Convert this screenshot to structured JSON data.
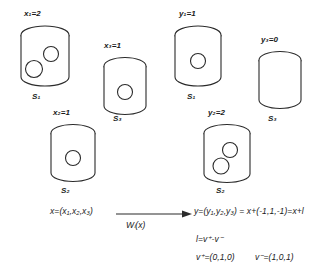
{
  "diagram": {
    "stroke_color": "#2b2b2b",
    "background": "#ffffff",
    "containers": [
      {
        "id": "left-s1",
        "var_label": "x",
        "var_sub": "1",
        "var_value": "2",
        "var_text": "x₁=2",
        "name_label": "S",
        "name_sub": "1",
        "name_text": "S₁",
        "items": 2,
        "side": "left"
      },
      {
        "id": "left-s3",
        "var_label": "x",
        "var_sub": "3",
        "var_value": "1",
        "var_text": "x₃=1",
        "name_label": "S",
        "name_sub": "3",
        "name_text": "S₃",
        "items": 1,
        "side": "left"
      },
      {
        "id": "left-s2",
        "var_label": "x",
        "var_sub": "2",
        "var_value": "1",
        "var_text": "x₂=1",
        "name_label": "S",
        "name_sub": "2",
        "name_text": "S₂",
        "items": 1,
        "side": "left"
      },
      {
        "id": "right-s1",
        "var_label": "y",
        "var_sub": "1",
        "var_value": "1",
        "var_text": "y₁=1",
        "name_label": "S",
        "name_sub": "1",
        "name_text": "S₁",
        "items": 1,
        "side": "right"
      },
      {
        "id": "right-s3",
        "var_label": "y",
        "var_sub": "3",
        "var_value": "0",
        "var_text": "y₃=0",
        "name_label": "S",
        "name_sub": "3",
        "name_text": "S₃",
        "items": 0,
        "side": "right"
      },
      {
        "id": "right-s2",
        "var_label": "y",
        "var_sub": "2",
        "var_value": "2",
        "var_text": "y₂=2",
        "name_label": "S",
        "name_sub": "2",
        "name_text": "S₂",
        "items": 2,
        "side": "right"
      }
    ],
    "equations": {
      "input_vector": "x=(x₁,x₂,x₃)",
      "transform_label": "Wₗ(x)",
      "output_vector": "y=(y₁,y₂,y₃) = x+(-1,1,-1)=x+l",
      "l_definition": "l=v⁺-v⁻",
      "v_plus": "v⁺=(0,1,0)",
      "v_minus": "v⁻=(1,0,1)"
    }
  }
}
